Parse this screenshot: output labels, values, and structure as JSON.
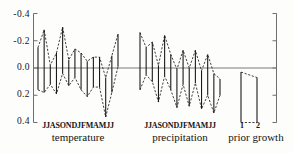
{
  "chart_data": {
    "type": "bar",
    "title": "",
    "xlabel": "",
    "ylabel": "",
    "ylim": [
      -0.45,
      0.45
    ],
    "grid": false,
    "legend": "none",
    "y_axis": {
      "tick_values": [
        -0.4,
        -0.2,
        0.0,
        0.2,
        0.4
      ],
      "tick_labels": [
        "-0.4",
        "-0.2",
        "0.0",
        "0.2",
        "0.4"
      ],
      "right_axis_ticks": true,
      "zero_line": 0.0
    },
    "panels": [
      {
        "name": "temperature",
        "label": "temperature",
        "tick_label_string": "JJASONDJFMAMJJ",
        "categories": [
          "J",
          "J",
          "A",
          "S",
          "O",
          "N",
          "D",
          "J",
          "F",
          "M",
          "A",
          "M",
          "J",
          "J"
        ],
        "series": [
          {
            "name": "upper bound",
            "values": [
              0.16,
              0.18,
              0.12,
              0.19,
              0.04,
              0.13,
              0.07,
              0.16,
              0.21,
              0.14,
              0.14,
              0.36,
              0.18,
              -0.01
            ]
          },
          {
            "name": "lower bound",
            "values": [
              -0.15,
              -0.28,
              -0.02,
              -0.11,
              -0.3,
              -0.06,
              -0.14,
              -0.11,
              -0.05,
              -0.08,
              -0.08,
              0.07,
              -0.09,
              -0.25
            ]
          }
        ]
      },
      {
        "name": "precipitation",
        "label": "precipitation",
        "tick_label_string": "JJASONDJFMAMJJ",
        "categories": [
          "J",
          "J",
          "A",
          "S",
          "O",
          "N",
          "D",
          "J",
          "F",
          "M",
          "A",
          "M",
          "J",
          "J"
        ],
        "series": [
          {
            "name": "upper bound",
            "values": [
              0.16,
              0.05,
              0.1,
              0.25,
              0.06,
              0.16,
              0.29,
              0.12,
              0.28,
              0.11,
              0.3,
              0.2,
              0.33,
              0.2
            ]
          },
          {
            "name": "lower bound",
            "values": [
              -0.26,
              -0.15,
              -0.19,
              -0.02,
              -0.24,
              -0.1,
              0.01,
              -0.13,
              0.0,
              -0.13,
              0.02,
              -0.1,
              0.04,
              0.08
            ]
          }
        ]
      },
      {
        "name": "prior growth",
        "label": "prior growth",
        "categories": [
          "1",
          "2"
        ],
        "series": [
          {
            "name": "upper bound",
            "values": [
              0.4,
              0.4
            ]
          },
          {
            "name": "lower bound",
            "values": [
              0.03,
              0.07
            ]
          }
        ]
      }
    ]
  },
  "style": {
    "bar_color": "#1a1a1a",
    "dashed_color": "#2b2b2b",
    "axis_color": "#6f6f6f",
    "zero_line_color": "#7a7a7a",
    "background": "#fdfdfc"
  }
}
